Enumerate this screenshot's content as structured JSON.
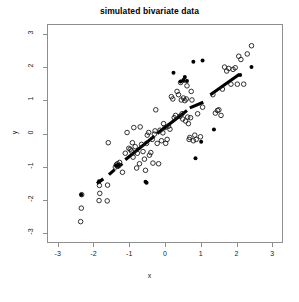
{
  "chart_data": {
    "type": "scatter",
    "title": "simulated bivariate data",
    "xlabel": "x",
    "ylabel": "y",
    "xlim": [
      -3.3,
      3.3
    ],
    "ylim": [
      -3.3,
      3.3
    ],
    "grid": false,
    "legend": null,
    "xticks": [
      -3,
      -2,
      -1,
      0,
      1,
      2,
      3
    ],
    "yticks": [
      -3,
      -2,
      -1,
      0,
      1,
      2,
      3
    ],
    "xtick_labels": [
      "-3",
      "-2",
      "-1",
      "0",
      "1",
      "2",
      "3"
    ],
    "ytick_labels": [
      "-3",
      "-2",
      "-1",
      "0",
      "1",
      "2",
      "3"
    ],
    "series": [
      {
        "name": "open-circles",
        "marker": "open-circle",
        "color": "#1a1a1a",
        "radius": 2.3,
        "points": [
          [
            -2.38,
            -2.68
          ],
          [
            -2.36,
            -2.27
          ],
          [
            -2.35,
            -1.86
          ],
          [
            -1.86,
            -2.04
          ],
          [
            -1.84,
            -1.82
          ],
          [
            -1.85,
            -1.58
          ],
          [
            -1.63,
            -2.05
          ],
          [
            -1.62,
            -1.57
          ],
          [
            -1.6,
            -0.28
          ],
          [
            -1.4,
            -1.02
          ],
          [
            -1.37,
            -0.95
          ],
          [
            -1.34,
            -0.92
          ],
          [
            -1.33,
            -1.0
          ],
          [
            -1.3,
            -0.97
          ],
          [
            -1.28,
            -0.88
          ],
          [
            -1.2,
            -1.18
          ],
          [
            -1.12,
            -0.6
          ],
          [
            -1.07,
            0.03
          ],
          [
            -1.02,
            -0.45
          ],
          [
            -0.98,
            -0.48
          ],
          [
            -0.95,
            -0.53
          ],
          [
            -0.92,
            -0.28
          ],
          [
            -0.9,
            -0.72
          ],
          [
            -0.88,
            0.18
          ],
          [
            -0.84,
            -0.4
          ],
          [
            -0.8,
            -1.05
          ],
          [
            -0.78,
            -0.6
          ],
          [
            -0.72,
            -0.92
          ],
          [
            -0.7,
            0.2
          ],
          [
            -0.66,
            -0.33
          ],
          [
            -0.62,
            -0.55
          ],
          [
            -0.58,
            -0.78
          ],
          [
            -0.55,
            -1.12
          ],
          [
            -0.52,
            -0.3
          ],
          [
            -0.5,
            -0.05
          ],
          [
            -0.46,
            0.03
          ],
          [
            -0.44,
            -0.66
          ],
          [
            -0.4,
            -0.58
          ],
          [
            -0.36,
            -0.18
          ],
          [
            -0.34,
            -0.9
          ],
          [
            -0.3,
            -0.02
          ],
          [
            -0.28,
            0.08
          ],
          [
            -0.26,
            0.72
          ],
          [
            -0.22,
            -0.3
          ],
          [
            -0.18,
            -0.92
          ],
          [
            -0.14,
            0.1
          ],
          [
            -0.1,
            -0.22
          ],
          [
            -0.06,
            0.02
          ],
          [
            -0.04,
            0.3
          ],
          [
            0.0,
            0.18
          ],
          [
            0.02,
            -0.3
          ],
          [
            0.06,
            -0.18
          ],
          [
            0.1,
            0.22
          ],
          [
            0.14,
            0.13
          ],
          [
            0.18,
            1.12
          ],
          [
            0.22,
            1.05
          ],
          [
            0.26,
            0.48
          ],
          [
            0.3,
            0.55
          ],
          [
            0.34,
            1.28
          ],
          [
            0.38,
            1.18
          ],
          [
            0.42,
            0.52
          ],
          [
            0.44,
            1.55
          ],
          [
            0.46,
            1.02
          ],
          [
            0.48,
            0.6
          ],
          [
            0.5,
            0.44
          ],
          [
            0.52,
            1.08
          ],
          [
            0.54,
            1.62
          ],
          [
            0.56,
            1.0
          ],
          [
            0.58,
            0.38
          ],
          [
            0.6,
            1.05
          ],
          [
            0.62,
            1.45
          ],
          [
            0.64,
            0.5
          ],
          [
            0.66,
            0.3
          ],
          [
            0.68,
            -0.18
          ],
          [
            0.7,
            -0.12
          ],
          [
            0.72,
            0.48
          ],
          [
            0.74,
            1.28
          ],
          [
            0.76,
            1.02
          ],
          [
            0.8,
            -0.22
          ],
          [
            0.84,
            -0.05
          ],
          [
            0.88,
            -0.18
          ],
          [
            0.92,
            0.6
          ],
          [
            1.0,
            -0.1
          ],
          [
            1.06,
            0.8
          ],
          [
            1.35,
            1.18
          ],
          [
            1.42,
            0.62
          ],
          [
            1.48,
            0.7
          ],
          [
            1.52,
            0.72
          ],
          [
            1.58,
            0.55
          ],
          [
            1.62,
            1.35
          ],
          [
            1.68,
            2.02
          ],
          [
            1.74,
            1.9
          ],
          [
            1.8,
            1.98
          ],
          [
            1.86,
            1.5
          ],
          [
            1.92,
            1.95
          ],
          [
            1.98,
            2.0
          ],
          [
            2.04,
            1.5
          ],
          [
            2.08,
            2.35
          ],
          [
            2.14,
            2.25
          ],
          [
            2.22,
            1.5
          ],
          [
            2.32,
            2.42
          ],
          [
            2.44,
            2.67
          ]
        ]
      },
      {
        "name": "filled-dots",
        "marker": "filled-circle",
        "color": "#000000",
        "radius": 2.0,
        "points": [
          [
            -2.36,
            -1.86
          ],
          [
            -1.86,
            -1.45
          ],
          [
            -1.38,
            -0.98
          ],
          [
            -1.33,
            -0.95
          ],
          [
            -0.55,
            -1.47
          ],
          [
            -0.52,
            -1.5
          ],
          [
            0.24,
            1.85
          ],
          [
            0.44,
            1.58
          ],
          [
            0.52,
            1.62
          ],
          [
            0.56,
            1.72
          ],
          [
            0.62,
            1.6
          ],
          [
            0.8,
            2.18
          ],
          [
            0.86,
            -0.75
          ],
          [
            1.02,
            -0.25
          ],
          [
            1.06,
            2.22
          ],
          [
            1.38,
            0.12
          ],
          [
            2.12,
            1.78
          ],
          [
            2.44,
            2.02
          ]
        ]
      }
    ],
    "dashed_line": {
      "name": "fitted-dashed-line",
      "style": "thick-dashed",
      "color": "#000000",
      "width": 3.2,
      "segments": [
        [
          [
            -1.92,
            -1.52
          ],
          [
            -1.74,
            -1.38
          ]
        ],
        [
          [
            -1.58,
            -1.25
          ],
          [
            -1.42,
            -1.1
          ]
        ],
        [
          [
            -1.34,
            -1.02
          ],
          [
            -1.2,
            -0.92
          ]
        ],
        [
          [
            -1.12,
            -0.8
          ],
          [
            -0.3,
            -0.08
          ]
        ],
        [
          [
            -0.22,
            0.0
          ],
          [
            0.62,
            0.7
          ]
        ],
        [
          [
            0.7,
            0.78
          ],
          [
            1.08,
            0.95
          ]
        ],
        [
          [
            1.28,
            1.18
          ],
          [
            2.1,
            1.8
          ]
        ]
      ]
    }
  },
  "figure": {
    "background": "#ffffff",
    "box_color": "#8d8d8d"
  }
}
